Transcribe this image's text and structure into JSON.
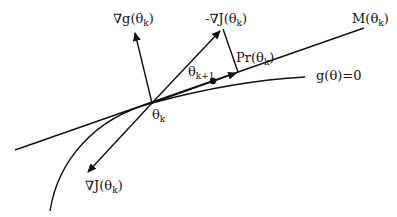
{
  "diagram": {
    "type": "constrained gradient projection",
    "labels": {
      "grad_g": {
        "main": "∇g(θ",
        "sub": "k",
        "close": ")"
      },
      "neg_grad_J": {
        "main": "-∇J(θ",
        "sub": "k",
        "close": ")"
      },
      "tangent": {
        "main": "M(θ",
        "sub": "k",
        "close": ")"
      },
      "projection": {
        "main": "Pr(θ",
        "sub": "k",
        "close": ")"
      },
      "next_point": {
        "main": "θ",
        "sub": "k+1"
      },
      "constraint": {
        "main": "g(θ)=0"
      },
      "current_point": {
        "main": "θ",
        "sub": "k"
      },
      "grad_J": {
        "main": "∇J(θ",
        "sub": "k",
        "close": ")"
      }
    },
    "colors": {
      "ink": "#111111",
      "background": "#ffffff"
    }
  }
}
